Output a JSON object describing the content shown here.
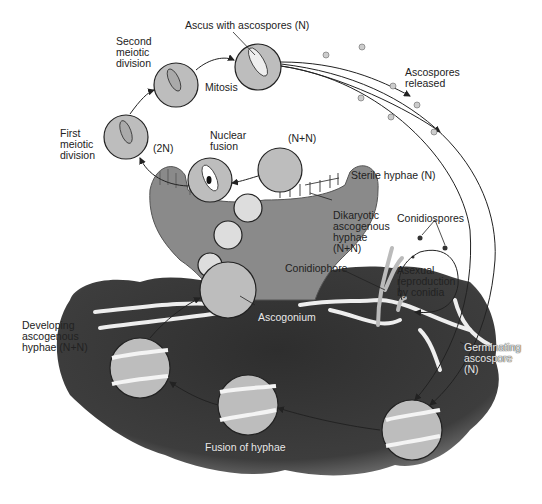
{
  "diagram": {
    "colors": {
      "background": "#ffffff",
      "soil": "#3a3a3a",
      "soil_edge": "#777777",
      "ascocarp": "#8a8a8a",
      "circle_fill": "#bdbdbd",
      "hyphae": "#eeeeee",
      "line": "#222222",
      "text": "#222222"
    },
    "labels": {
      "ascus_with_ascospores": "Ascus with ascospores (N)",
      "second_meiotic": "Second\nmeiotic\ndivision",
      "mitosis": "Mitosis",
      "first_meiotic": "First\nmeiotic\ndivision",
      "two_n": "(2N)",
      "nuclear_fusion": "Nuclear\nfusion",
      "n_plus_n": "(N+N)",
      "ascospores_released": "Ascospores\nreleased",
      "sterile_hyphae": "Sterile hyphae (N)",
      "dikaryotic": "Dikaryotic\nascogenous\nhyphae\n(N+N)",
      "conidiospores": "Conidiospores",
      "conidiophore": "Conidiophore",
      "asexual": "Asexual\nreproduction\nby conidia",
      "ascogonium": "Ascogonium",
      "developing": "Developing\nascogenous\nhyphae (N+N)",
      "germinating": "Germinating\nascospore\n(N)",
      "fusion": "Fusion of hyphae"
    },
    "stages": [
      "Fusion of hyphae",
      "Developing ascogenous hyphae (N+N)",
      "Ascogonium",
      "Dikaryotic ascogenous hyphae (N+N)",
      "(N+N)",
      "Nuclear fusion (2N)",
      "First meiotic division",
      "Second meiotic division",
      "Mitosis",
      "Ascus with ascospores (N)",
      "Ascospores released",
      "Germinating ascospore (N)"
    ]
  }
}
